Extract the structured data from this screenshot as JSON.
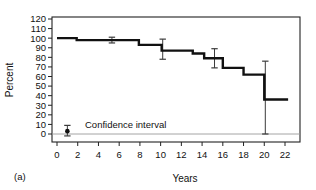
{
  "figure": {
    "panel_label": "(a)",
    "legend_label": "Confidence interval",
    "colors": {
      "curve": "#111111",
      "axis": "#222222",
      "errorbar": "#3a3a3a",
      "background": "#ffffff"
    }
  },
  "chart_data": {
    "type": "line",
    "title": "",
    "subtitle": "",
    "xlabel": "Years",
    "ylabel": "Percent",
    "xlim": [
      -1,
      23
    ],
    "ylim": [
      0,
      120
    ],
    "xticks": [
      0,
      2,
      4,
      6,
      8,
      10,
      12,
      14,
      16,
      18,
      20,
      22
    ],
    "xtick_labels": [
      "0",
      "2",
      "4",
      "6",
      "8",
      "10",
      "12",
      "14",
      "16",
      "18",
      "20",
      "22"
    ],
    "yticks": [
      0,
      10,
      20,
      30,
      40,
      50,
      60,
      70,
      80,
      90,
      100,
      110,
      120
    ],
    "ytick_labels": [
      "0",
      "10",
      "20",
      "30",
      "40",
      "50",
      "60",
      "70",
      "80",
      "90",
      "100",
      "110",
      "120"
    ],
    "grid": false,
    "legend_position": "inside-lower-left",
    "step_style": "post",
    "series": [
      {
        "name": "Survival",
        "type": "step",
        "x": [
          0,
          1.8,
          2.0,
          7.7,
          8.1,
          9.9,
          10.3,
          13.0,
          13.3,
          14.1,
          14.4,
          15.9,
          16.2,
          17.9,
          18.2,
          19.9,
          20.2,
          22.3
        ],
        "y": [
          100,
          100,
          98,
          98,
          93,
          93,
          87,
          87,
          84,
          84,
          79,
          79,
          69,
          69,
          62,
          62,
          36,
          36
        ]
      }
    ],
    "steps": [
      {
        "x_start": 0.0,
        "x_end": 1.9,
        "percent": 100
      },
      {
        "x_start": 1.9,
        "x_end": 7.9,
        "percent": 98
      },
      {
        "x_start": 7.9,
        "x_end": 10.1,
        "percent": 93
      },
      {
        "x_start": 10.1,
        "x_end": 13.1,
        "percent": 87
      },
      {
        "x_start": 13.1,
        "x_end": 14.2,
        "percent": 84
      },
      {
        "x_start": 14.2,
        "x_end": 16.0,
        "percent": 79
      },
      {
        "x_start": 16.0,
        "x_end": 18.0,
        "percent": 69
      },
      {
        "x_start": 18.0,
        "x_end": 20.0,
        "percent": 62
      },
      {
        "x_start": 20.0,
        "x_end": 22.3,
        "percent": 36
      }
    ],
    "error_bars": [
      {
        "x": 5.3,
        "value": 98,
        "lower": 95,
        "upper": 101
      },
      {
        "x": 10.2,
        "value": 90,
        "lower": 78,
        "upper": 99
      },
      {
        "x": 15.2,
        "value": 79,
        "lower": 69,
        "upper": 89
      },
      {
        "x": 20.1,
        "value": 55,
        "lower": 0,
        "upper": 76
      }
    ],
    "legend_marker": {
      "x": 1.0,
      "value": 3,
      "lower": -2,
      "upper": 9
    }
  }
}
